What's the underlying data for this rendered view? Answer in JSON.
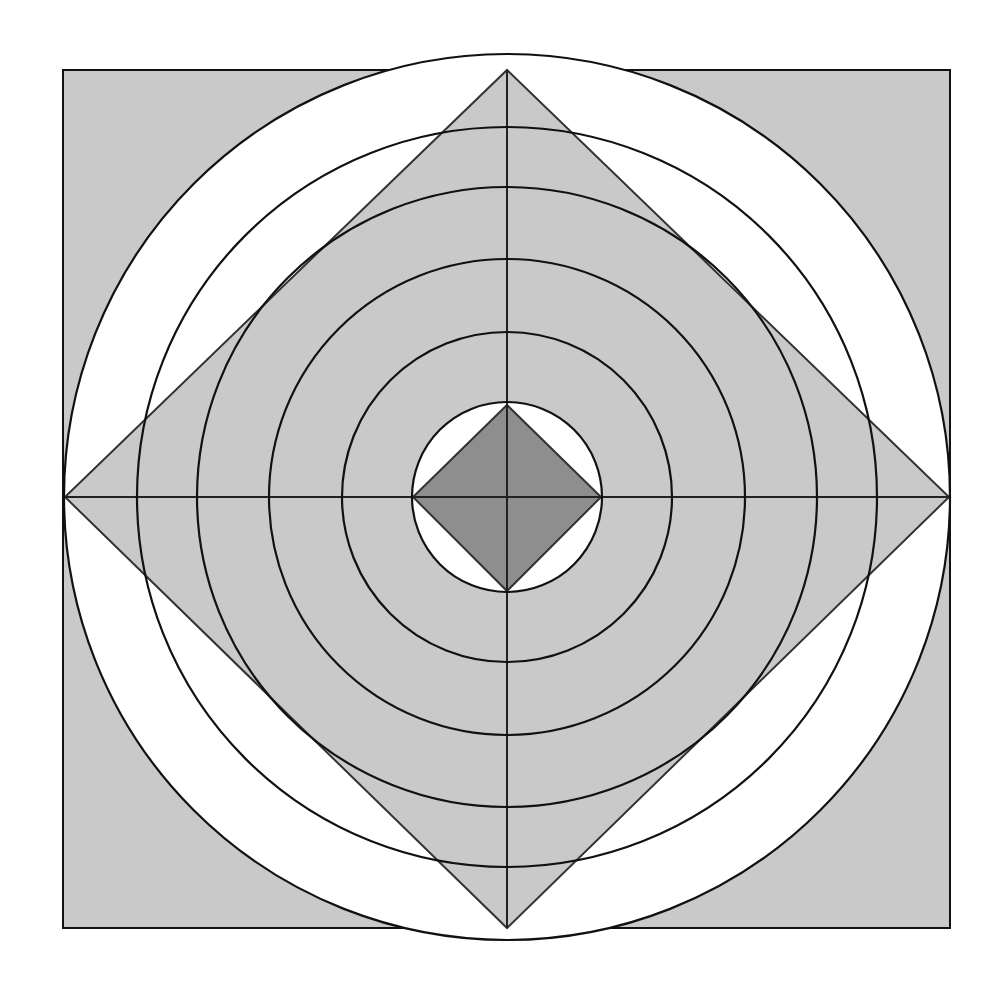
{
  "diagram": {
    "type": "geometric-figure",
    "colors": {
      "background": "#ffffff",
      "light_fill": "#c9c9c9",
      "dark_fill": "#8e8e8e",
      "white_fill": "#ffffff",
      "stroke": "#111111"
    },
    "center": [
      507,
      497
    ],
    "outer_square": {
      "x": 63,
      "y": 70,
      "width": 887,
      "height": 858
    },
    "outer_diamond": {
      "points": [
        [
          507,
          70
        ],
        [
          949,
          497
        ],
        [
          507,
          928
        ],
        [
          65,
          497
        ]
      ]
    },
    "circles_radii": [
      443,
      370,
      310,
      238,
      165,
      95
    ],
    "inner_diamond": {
      "points": [
        [
          507,
          405
        ],
        [
          601,
          497
        ],
        [
          507,
          591
        ],
        [
          413,
          497
        ]
      ]
    },
    "crosshair": {
      "horizontal": [
        [
          65,
          497
        ],
        [
          949,
          497
        ]
      ],
      "vertical": [
        [
          507,
          70
        ],
        [
          507,
          928
        ]
      ]
    }
  }
}
